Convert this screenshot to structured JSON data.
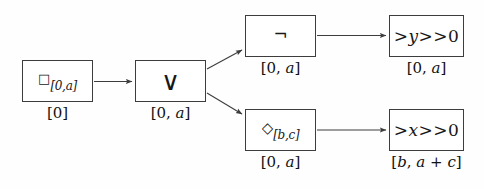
{
  "figure": {
    "background_color": "#fefefe",
    "stroke_color": "#3d3d3d",
    "text_color": "#111111"
  },
  "nodes": {
    "box": {
      "operator_glyph": "□",
      "operator_name": "box-always-operator",
      "subscript": "[0,a]",
      "caption": "[0]"
    },
    "disjunction": {
      "operator_glyph": "∨",
      "operator_name": "logical-or-operator",
      "subscript": "",
      "caption": "[0, a]"
    },
    "negation": {
      "operator_glyph": "¬",
      "operator_name": "logical-not-operator",
      "subscript": "",
      "caption": "[0, a]"
    },
    "diamond": {
      "operator_glyph": "◇",
      "operator_name": "diamond-eventually-operator",
      "subscript": "[b,c]",
      "caption": "[0, a]"
    },
    "y_predicate": {
      "variable": "y",
      "relation": ">",
      "value": "0",
      "formula": "y > 0",
      "caption": "[0, a]"
    },
    "x_predicate": {
      "variable": "x",
      "relation": ">",
      "value": "0",
      "formula": "x > 0",
      "caption": "[b, a + c]"
    }
  },
  "edges": [
    {
      "name": "box-to-or",
      "from": "box",
      "to": "disjunction"
    },
    {
      "name": "or-to-not",
      "from": "disjunction",
      "to": "negation"
    },
    {
      "name": "or-to-diamond",
      "from": "disjunction",
      "to": "diamond"
    },
    {
      "name": "not-to-y",
      "from": "negation",
      "to": "y_predicate"
    },
    {
      "name": "diamond-to-x",
      "from": "diamond",
      "to": "x_predicate"
    }
  ]
}
